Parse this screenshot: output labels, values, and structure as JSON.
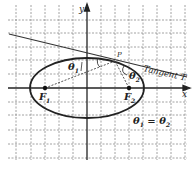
{
  "diagram": {
    "axes": {
      "x_label": "x",
      "y_label": "y"
    },
    "foci": [
      {
        "label": "F",
        "subscript": "1",
        "cx": 45,
        "cy": 88
      },
      {
        "label": "F",
        "subscript": "2",
        "cx": 129,
        "cy": 88
      }
    ],
    "point_label": "P",
    "tangent_label": "Tangent T",
    "angle_labels": {
      "theta1": {
        "main": "θ",
        "sub": "1"
      },
      "theta2": {
        "main": "θ",
        "sub": "2"
      }
    },
    "equation": {
      "left": "θ",
      "left_sub": "1",
      "eq": " = ",
      "right": "θ",
      "right_sub": "2"
    },
    "colors": {
      "ink": "#222222",
      "grid": "#8a8a8a",
      "background": "#ffffff"
    }
  }
}
